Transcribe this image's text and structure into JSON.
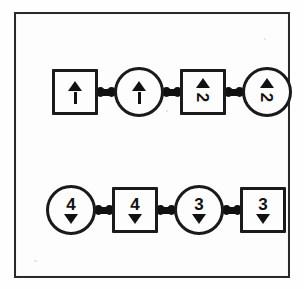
{
  "diagram": {
    "background_color": "#fdfdfd",
    "stroke_color": "#1a1a1a",
    "frame": {
      "style": "rectangle-border",
      "border_color": "#2a2a2a"
    },
    "rows": [
      {
        "id": "row-top",
        "name": "top-chain",
        "arrow_direction": "up",
        "digit_position": "below-arrow",
        "nodes": [
          {
            "shape": "square",
            "digit": "1",
            "arrow": "up",
            "glyph_style": "arrow-over-stem",
            "rotated_digit": false
          },
          {
            "shape": "circle",
            "digit": "1",
            "arrow": "up",
            "glyph_style": "arrow-over-stem",
            "rotated_digit": false
          },
          {
            "shape": "square",
            "digit": "2",
            "arrow": "up",
            "glyph_style": "arrow-over-digit",
            "rotated_digit": true
          },
          {
            "shape": "circle",
            "digit": "2",
            "arrow": "up",
            "glyph_style": "arrow-over-digit",
            "rotated_digit": true
          }
        ]
      },
      {
        "id": "row-bottom",
        "name": "bottom-chain",
        "arrow_direction": "down",
        "digit_position": "above-arrow",
        "nodes": [
          {
            "shape": "circle",
            "digit": "4",
            "arrow": "down",
            "glyph_style": "digit-over-arrow",
            "rotated_digit": false
          },
          {
            "shape": "square",
            "digit": "4",
            "arrow": "down",
            "glyph_style": "digit-over-arrow",
            "rotated_digit": false
          },
          {
            "shape": "circle",
            "digit": "3",
            "arrow": "down",
            "glyph_style": "digit-over-arrow",
            "rotated_digit": false
          },
          {
            "shape": "square",
            "digit": "3",
            "arrow": "down",
            "glyph_style": "digit-over-arrow",
            "rotated_digit": false
          }
        ]
      }
    ],
    "connector": {
      "name": "link-dumbbell",
      "count_per_row": 3
    }
  }
}
